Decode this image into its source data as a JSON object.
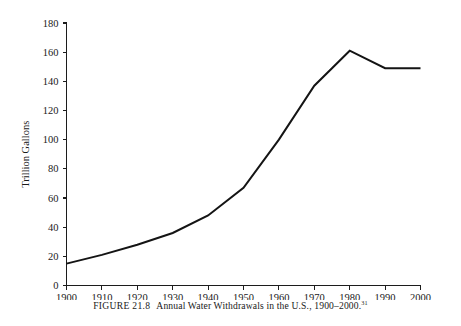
{
  "chart_data": {
    "type": "line",
    "title": "",
    "xlabel": "",
    "ylabel": "Trillion Gallons",
    "x": [
      1900,
      1910,
      1920,
      1930,
      1940,
      1950,
      1960,
      1970,
      1980,
      1990,
      2000
    ],
    "values": [
      15,
      21,
      28,
      36,
      48,
      67,
      100,
      137,
      161,
      149,
      149
    ],
    "series": [
      {
        "name": "Annual Water Withdrawals",
        "values": [
          15,
          21,
          28,
          36,
          48,
          67,
          100,
          137,
          161,
          149,
          149
        ]
      }
    ],
    "xtick_labels": [
      "1900",
      "1910",
      "1920",
      "1930",
      "1940",
      "1950",
      "1960",
      "1970",
      "1980",
      "1990",
      "2000"
    ],
    "ytick_labels": [
      "0",
      "20",
      "40",
      "60",
      "80",
      "100",
      "120",
      "140",
      "160",
      "180"
    ],
    "yticks": [
      0,
      20,
      40,
      60,
      80,
      100,
      120,
      140,
      160,
      180
    ],
    "xlim": [
      1900,
      2000
    ],
    "ylim": [
      0,
      180
    ],
    "grid": false,
    "legend": false,
    "line_color": "#141414"
  },
  "caption": {
    "figure_label": "FIGURE 21.8",
    "figure_title": "Annual Water Withdrawals in the U.S., 1900–2000.",
    "footnote_marker": "31"
  }
}
